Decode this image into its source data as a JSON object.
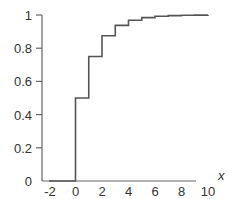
{
  "chart_data": {
    "type": "line",
    "subtype": "step-cdf",
    "title": "",
    "xlabel": "x",
    "ylabel": "",
    "xlim": [
      -2,
      10
    ],
    "ylim": [
      0,
      1
    ],
    "x_ticks": [
      -2,
      0,
      2,
      4,
      6,
      8,
      10
    ],
    "x_tick_labels": [
      "-2",
      "0",
      "2",
      "4",
      "6",
      "8",
      "10"
    ],
    "y_ticks": [
      0,
      0.2,
      0.4,
      0.6,
      0.8,
      1
    ],
    "y_tick_labels": [
      "0",
      "0.2",
      "0.4",
      "0.6",
      "0.8",
      "1"
    ],
    "grid": false,
    "legend": null,
    "series": [
      {
        "name": "F(x)",
        "step_x": [
          -2,
          0,
          1,
          2,
          3,
          4,
          5,
          6,
          7,
          8,
          9,
          10
        ],
        "step_y": [
          0,
          0.5,
          0.75,
          0.875,
          0.9375,
          0.96875,
          0.984375,
          0.9921875,
          0.99609375,
          0.998046875,
          0.9990234375,
          0.99951171875
        ],
        "color": "#555555"
      }
    ]
  }
}
